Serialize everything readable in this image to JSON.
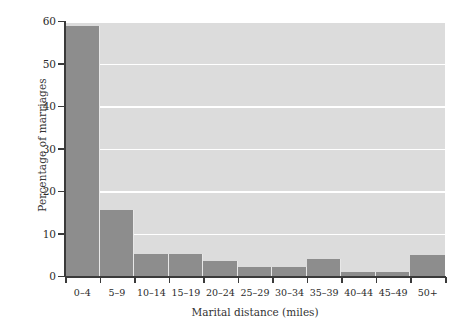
{
  "chart_data": {
    "type": "bar",
    "title": "",
    "subtitle": "",
    "xlabel": "Marital distance (miles)",
    "ylabel": "Percentage of marriages",
    "categories": [
      "0–4",
      "5–9",
      "10–14",
      "15–19",
      "20–24",
      "25–29",
      "30–34",
      "35–39",
      "40–44",
      "45–49",
      "50+"
    ],
    "values": [
      58.8,
      15.5,
      5.2,
      5.2,
      3.6,
      2.2,
      2.2,
      4.1,
      0.9,
      0.9,
      4.9
    ],
    "ylim": [
      0,
      60
    ],
    "ytick_values": [
      0,
      10,
      20,
      30,
      40,
      50,
      60
    ],
    "ytick_labels": [
      "0",
      "10",
      "20",
      "30",
      "40",
      "50",
      "60"
    ],
    "grid": "horizontal-white-gridlines",
    "legend": "none",
    "bar_gap": 0,
    "colors": {
      "bar": "#8d8d8d",
      "plot_background": "#dcdcdc",
      "gridline": "#ffffff",
      "axis": "#3a3a3a",
      "text": "#2b2b2b",
      "figure_background": "#ffffff"
    }
  }
}
